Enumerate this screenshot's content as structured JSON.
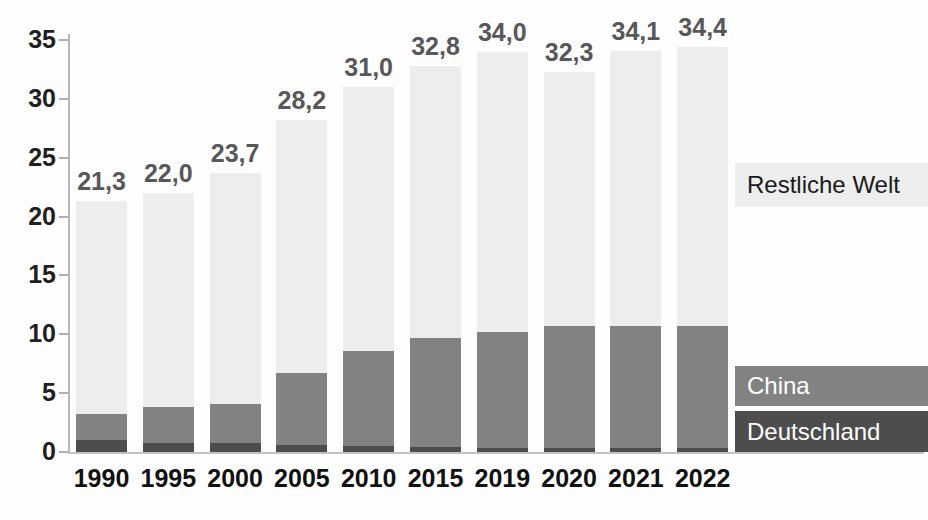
{
  "chart_data": {
    "type": "bar",
    "subtype": "stacked-bar",
    "title": "",
    "xlabel": "",
    "ylabel": "",
    "ylim": [
      0,
      35
    ],
    "grid": false,
    "legend_position": "right",
    "categories": [
      "1990",
      "1995",
      "2000",
      "2005",
      "2010",
      "2015",
      "2019",
      "2020",
      "2021",
      "2022"
    ],
    "y_ticks": [
      "0",
      "5",
      "10",
      "15",
      "20",
      "25",
      "30",
      "35"
    ],
    "y_tick_values": [
      0,
      5,
      10,
      15,
      20,
      25,
      30,
      35
    ],
    "series": [
      {
        "name": "Deutschland",
        "color": "#4d4d4d",
        "values": [
          1.0,
          0.8,
          0.75,
          0.6,
          0.5,
          0.4,
          0.35,
          0.3,
          0.3,
          0.3
        ]
      },
      {
        "name": "China",
        "color": "#828282",
        "values": [
          2.2,
          3.0,
          3.35,
          6.1,
          8.1,
          9.3,
          9.85,
          10.4,
          10.4,
          10.4
        ]
      },
      {
        "name": "Restliche Welt",
        "color": "#ededed",
        "values": [
          18.1,
          18.2,
          19.6,
          21.5,
          22.4,
          23.1,
          23.8,
          21.6,
          23.4,
          23.7
        ]
      }
    ],
    "totals": [
      21.3,
      22.0,
      23.7,
      28.2,
      31.0,
      32.8,
      34.0,
      32.3,
      34.1,
      34.4
    ],
    "total_labels": [
      "21,3",
      "22,0",
      "23,7",
      "28,2",
      "31,0",
      "32,8",
      "34,0",
      "32,3",
      "34,1",
      "34,4"
    ],
    "stack_tops_china": [
      3.2,
      3.8,
      4.1,
      6.7,
      8.6,
      9.7,
      10.2,
      10.7,
      10.7,
      10.7
    ]
  },
  "legend": {
    "world": "Restliche Welt",
    "china": "China",
    "germany": "Deutschland"
  },
  "colors": {
    "world": "#ededed",
    "china": "#828282",
    "germany": "#4d4d4d",
    "value_label": "#58585a",
    "axis_label": "#111111",
    "axis_line": "#bbbbbb"
  }
}
